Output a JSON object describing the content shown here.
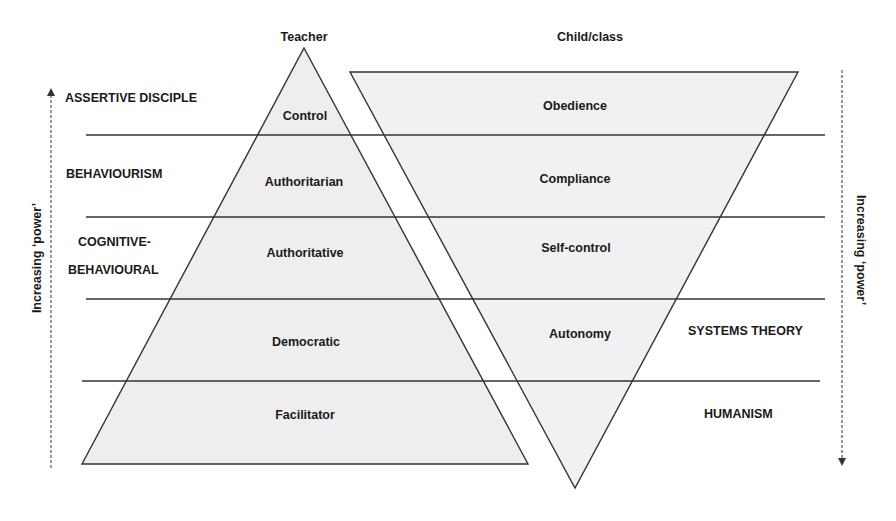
{
  "diagram": {
    "colors": {
      "fill": "#eeeeee",
      "stroke": "#333333",
      "text": "#1a1a1a",
      "background": "#ffffff"
    },
    "headers": {
      "teacher": "Teacher",
      "child": "Child/class"
    },
    "left_theories": [
      {
        "label": "ASSERTIVE DISCIPLE"
      },
      {
        "label": "BEHAVIOURISM"
      },
      {
        "label_line1": "COGNITIVE-",
        "label_line2": "BEHAVIOURAL"
      }
    ],
    "right_theories": [
      {
        "label": "SYSTEMS THEORY"
      },
      {
        "label": "HUMANISM"
      }
    ],
    "teacher_levels": [
      "Control",
      "Authoritarian",
      "Authoritative",
      "Democratic",
      "Facilitator"
    ],
    "child_levels": [
      "Obedience",
      "Compliance",
      "Self-control",
      "Autonomy"
    ],
    "axes": {
      "left_label": "Increasing ‘power’",
      "left_direction": "up",
      "right_label": "Increasing ‘power’",
      "right_direction": "down"
    }
  }
}
